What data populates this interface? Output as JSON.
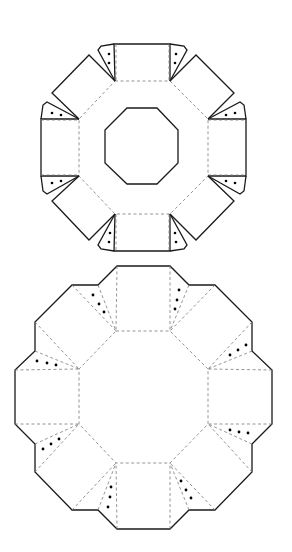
{
  "figure": {
    "colors": {
      "cut_line": "#1a1a1a",
      "fold_line": "#7a7a7a",
      "glue_dot": "#000000",
      "background": "#ffffff"
    }
  },
  "lid_net": {
    "label": "top template (lid with octagonal window)",
    "center": [
      143,
      148
    ],
    "fold_octagon": [
      [
        115,
        81
      ],
      [
        170,
        81
      ],
      [
        208,
        119
      ],
      [
        208,
        176
      ],
      [
        170,
        214
      ],
      [
        115,
        214
      ],
      [
        79,
        176
      ],
      [
        79,
        119
      ]
    ],
    "window_octagon": [
      [
        127,
        108
      ],
      [
        157,
        108
      ],
      [
        178,
        130
      ],
      [
        178,
        163
      ],
      [
        157,
        184
      ],
      [
        127,
        184
      ],
      [
        105,
        163
      ],
      [
        105,
        130
      ]
    ],
    "side_panels": 8,
    "glue_tabs": 8,
    "dots_per_tab": 2
  },
  "base_net": {
    "label": "bottom template (base)",
    "center": [
      143,
      404
    ],
    "fold_octagon": [
      [
        116,
        331
      ],
      [
        170,
        331
      ],
      [
        208,
        369
      ],
      [
        208,
        424
      ],
      [
        170,
        463
      ],
      [
        116,
        463
      ],
      [
        79,
        424
      ],
      [
        79,
        369
      ]
    ],
    "side_panels": 8,
    "glue_tabs": 8,
    "dots_per_tab": 3
  }
}
